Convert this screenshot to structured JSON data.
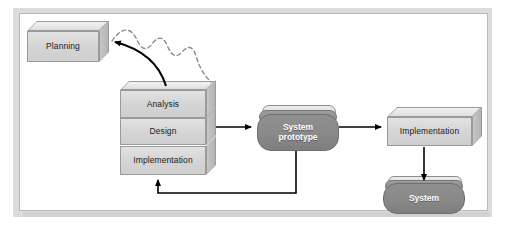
{
  "diagram": {
    "background_color": "#ffffff",
    "frame_color": "#dcdcdc",
    "panel_color": "#ffffff",
    "box_fill": "#d4d4d4",
    "capsule_fill": "#8a8a8a",
    "line_color": "#000000",
    "dashed_line_color": "#7a7a7a"
  },
  "nodes": {
    "planning": {
      "label": "Planning",
      "shape": "box3d"
    },
    "analysis": {
      "label": "Analysis",
      "shape": "box3d"
    },
    "design": {
      "label": "Design",
      "shape": "box3d"
    },
    "implementation_left": {
      "label": "Implementation",
      "shape": "box3d"
    },
    "system_prototype": {
      "label_line1": "System",
      "label_line2": "prototype",
      "shape": "capsule"
    },
    "implementation_right": {
      "label": "Implementation",
      "shape": "box3d"
    },
    "system": {
      "label": "System",
      "shape": "capsule"
    }
  },
  "connectors": [
    {
      "name": "analysis-to-planning",
      "style": "solid-curve-arrow"
    },
    {
      "name": "planning-wavy-feedback",
      "style": "dashed-wave"
    },
    {
      "name": "design-to-system-prototype",
      "style": "solid-arrow"
    },
    {
      "name": "system-prototype-to-implementation",
      "style": "solid-arrow"
    },
    {
      "name": "system-prototype-feedback-to-implementation-left",
      "style": "solid-elbow-arrow"
    },
    {
      "name": "implementation-to-system",
      "style": "solid-arrow"
    }
  ]
}
